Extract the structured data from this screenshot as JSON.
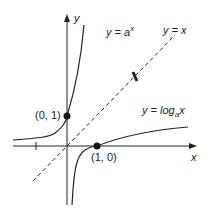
{
  "diagram": {
    "axis_x_label": "x",
    "axis_y_label": "y",
    "curve_exp_label": {
      "prefix": "y = a",
      "sup": "x"
    },
    "line_identity_label": "y = x",
    "curve_log_label": {
      "prefix": "y = log",
      "sub": "a",
      "suffix": "x"
    },
    "point_exp": "(0, 1)",
    "point_log": "(1, 0)",
    "colors": {
      "stroke": "#222222",
      "background": "#ffffff"
    }
  }
}
